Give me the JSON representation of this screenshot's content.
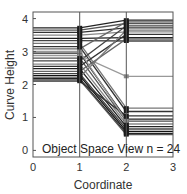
{
  "chart_data": {
    "type": "line",
    "title": "",
    "annotation": "Object Space View n = 24",
    "xlabel": "Coordinate",
    "ylabel": "Curve Height",
    "xlim": [
      0,
      3
    ],
    "ylim": [
      -0.2,
      4.2
    ],
    "xticks": [
      0,
      1,
      2,
      3
    ],
    "yticks": [
      0,
      1,
      2,
      3,
      4
    ],
    "grid": "vertical lines at x=1 and x=2",
    "x": [
      0,
      1,
      2,
      3
    ],
    "series": [
      {
        "name": "curve-1",
        "values": [
          3.72,
          3.72,
          3.95,
          3.95
        ],
        "color": "#222222"
      },
      {
        "name": "curve-2",
        "values": [
          3.65,
          3.65,
          3.85,
          3.85
        ],
        "color": "#555555"
      },
      {
        "name": "curve-3",
        "values": [
          3.58,
          3.58,
          3.72,
          3.72
        ],
        "color": "#333333"
      },
      {
        "name": "curve-4",
        "values": [
          3.5,
          3.5,
          3.6,
          3.6
        ],
        "color": "#888888"
      },
      {
        "name": "curve-5",
        "values": [
          3.4,
          3.4,
          3.42,
          3.42
        ],
        "color": "#222222"
      },
      {
        "name": "curve-6",
        "values": [
          3.33,
          3.33,
          3.32,
          3.32
        ],
        "color": "#444444"
      },
      {
        "name": "curve-7",
        "values": [
          3.25,
          3.25,
          1.28,
          1.28
        ],
        "color": "#777777"
      },
      {
        "name": "curve-8",
        "values": [
          3.15,
          3.15,
          1.18,
          1.18
        ],
        "color": "#333333"
      },
      {
        "name": "curve-9",
        "values": [
          3.08,
          3.08,
          3.9,
          3.9
        ],
        "color": "#666666"
      },
      {
        "name": "curve-10",
        "values": [
          2.95,
          2.95,
          0.95,
          0.95
        ],
        "color": "#222222"
      },
      {
        "name": "curve-11",
        "values": [
          2.88,
          2.88,
          2.25,
          2.25
        ],
        "color": "#999999"
      },
      {
        "name": "curve-12",
        "values": [
          2.8,
          2.8,
          0.88,
          0.88
        ],
        "color": "#555555"
      },
      {
        "name": "curve-13",
        "values": [
          2.72,
          2.72,
          3.78,
          3.78
        ],
        "color": "#444444"
      },
      {
        "name": "curve-14",
        "values": [
          2.62,
          2.62,
          0.8,
          0.8
        ],
        "color": "#888888"
      },
      {
        "name": "curve-15",
        "values": [
          2.55,
          2.55,
          3.52,
          3.52
        ],
        "color": "#333333"
      },
      {
        "name": "curve-16",
        "values": [
          2.48,
          2.48,
          0.72,
          0.72
        ],
        "color": "#222222"
      },
      {
        "name": "curve-17",
        "values": [
          2.4,
          2.4,
          3.38,
          3.38
        ],
        "color": "#666666"
      },
      {
        "name": "curve-18",
        "values": [
          2.33,
          2.33,
          0.65,
          0.65
        ],
        "color": "#444444"
      },
      {
        "name": "curve-19",
        "values": [
          2.27,
          2.27,
          0.58,
          0.58
        ],
        "color": "#111111"
      },
      {
        "name": "curve-20",
        "values": [
          2.22,
          2.22,
          3.65,
          3.65
        ],
        "color": "#777777"
      },
      {
        "name": "curve-21",
        "values": [
          2.18,
          2.18,
          0.52,
          0.52
        ],
        "color": "#222222"
      },
      {
        "name": "curve-22",
        "values": [
          2.14,
          2.14,
          0.48,
          0.48
        ],
        "color": "#555555"
      },
      {
        "name": "curve-23",
        "values": [
          2.1,
          2.1,
          1.05,
          1.05
        ],
        "color": "#333333"
      },
      {
        "name": "curve-24",
        "values": [
          3.0,
          3.0,
          0.9,
          0.9
        ],
        "color": "#999999"
      }
    ]
  }
}
